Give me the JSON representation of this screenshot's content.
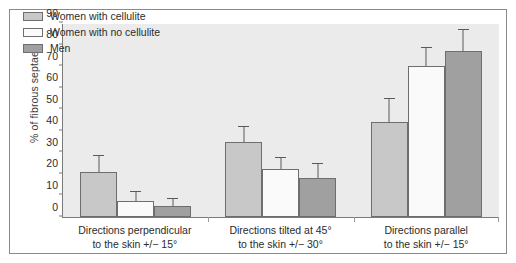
{
  "chart_data": {
    "type": "bar",
    "title": "",
    "subtitle": "",
    "xlabel": "",
    "ylabel": "% of fibrous septae",
    "ylim": [
      0,
      90
    ],
    "yticks": [
      0,
      10,
      20,
      30,
      40,
      50,
      60,
      70,
      80,
      90
    ],
    "grid": false,
    "legend_position": "top-left",
    "categories": [
      "Directions perpendicular\nto the skin +/− 15°",
      "Directions tilted at 45°\nto the skin +/− 30°",
      "Directions parallel\nto the skin +/− 15°"
    ],
    "category_lines": [
      [
        "Directions perpendicular",
        "to the skin +/− 15°"
      ],
      [
        "Directions tilted at 45°",
        "to the skin +/− 30°"
      ],
      [
        "Directions parallel",
        "to the skin +/− 15°"
      ]
    ],
    "series": [
      {
        "name": "Women with cellulite",
        "color": "#c8c8c8",
        "values": [
          21,
          35,
          44
        ],
        "errors_upper": [
          29,
          42,
          55
        ]
      },
      {
        "name": "Women with no cellulite",
        "color": "#fafafa",
        "values": [
          7.5,
          22.5,
          70
        ],
        "errors_upper": [
          12,
          28,
          79
        ]
      },
      {
        "name": "Men",
        "color": "#a0a0a0",
        "values": [
          5,
          18,
          77
        ],
        "errors_upper": [
          9,
          25,
          87
        ]
      }
    ]
  },
  "legend": {
    "items": [
      {
        "label": "Women with cellulite",
        "color": "#c8c8c8"
      },
      {
        "label": "Women with no cellulite",
        "color": "#fafafa"
      },
      {
        "label": "Men",
        "color": "#a0a0a0"
      }
    ]
  },
  "axes": {
    "y_title": "% of fibrous septae",
    "y_ticks": [
      "0",
      "10",
      "20",
      "30",
      "40",
      "50",
      "60",
      "70",
      "80",
      "90"
    ]
  },
  "colors": {
    "plot_background": "#ebebeb",
    "page_background": "#ffffff",
    "axis_line": "#7a7a7a",
    "bar_border": "#6e6e6e",
    "error_bar": "#5a5a5a",
    "text": "#2b2b2b",
    "frame": "#8a8a8a"
  }
}
